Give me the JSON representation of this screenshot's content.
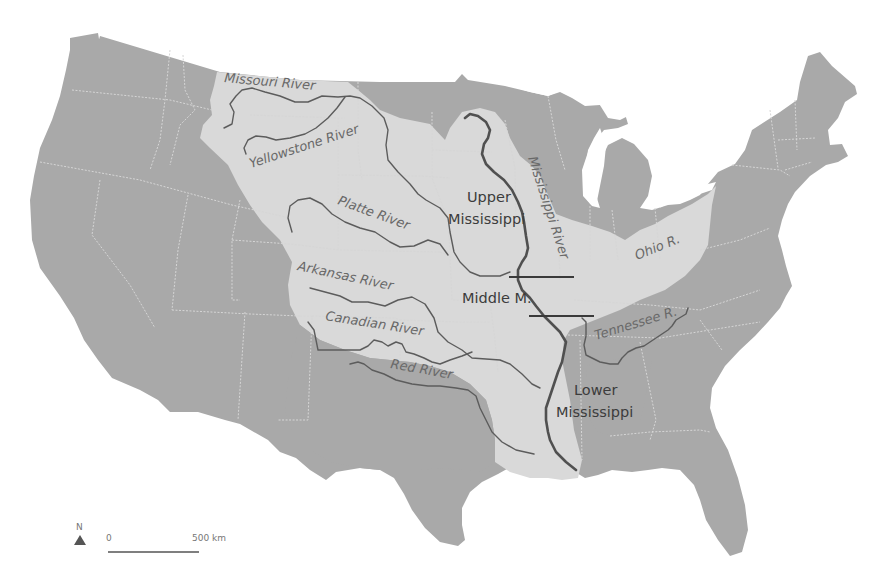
{
  "map": {
    "title": "Mississippi River Basin",
    "colors": {
      "land": "#a9a9a9",
      "basin": "#d9d9d9",
      "river": "#5c5c5c",
      "main_river": "#505050",
      "background": "#ffffff"
    },
    "rivers": [
      {
        "id": "missouri",
        "label": "Missouri River"
      },
      {
        "id": "yellowstone",
        "label": "Yellowstone River"
      },
      {
        "id": "platte",
        "label": "Platte River"
      },
      {
        "id": "arkansas",
        "label": "Arkansas River"
      },
      {
        "id": "canadian",
        "label": "Canadian River"
      },
      {
        "id": "red",
        "label": "Red River"
      },
      {
        "id": "mississippi",
        "label": "Mississippi River"
      },
      {
        "id": "ohio",
        "label": "Ohio R."
      },
      {
        "id": "tennessee",
        "label": "Tennessee R."
      }
    ],
    "regions": {
      "upper": {
        "line1": "Upper",
        "line2": "Mississippi"
      },
      "middle": {
        "line1": "Middle M."
      },
      "lower": {
        "line1": "Lower",
        "line2": "Mississippi"
      }
    },
    "north_arrow": {
      "label": "N"
    },
    "scale_bar": {
      "start_label": "0",
      "end_label": "500 km"
    }
  }
}
